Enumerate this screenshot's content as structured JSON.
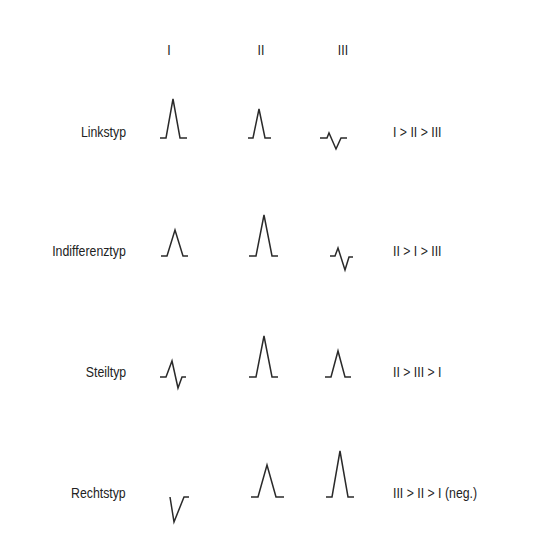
{
  "diagram": {
    "title": "",
    "column_headers": [
      "I",
      "II",
      "III"
    ],
    "rows": [
      {
        "label": "Linkstyp",
        "ranking": "I > II > III",
        "waves": {
          "I": "160,138 166,138 173,99 180,138 187,138",
          "II": "248,138 253,138 259,109 265,138 271,138",
          "III": "320,138 327,138 329,133 336,149 341,138 347,138"
        }
      },
      {
        "label": "Indifferenztyp",
        "ranking": "II > I > III",
        "waves": {
          "I": "161,256 167,256 175,230 183,256 188,256",
          "II": "249,256 256,256 264,215 272,256 278,256",
          "III": "330,256 335,256 338,248 345,270 349,257 353,257"
        }
      },
      {
        "label": "Steiltyp",
        "ranking": "II > III > I",
        "waves": {
          "I": "160,377 166,377 172,361 178,388 182,377 186,377",
          "II": "249,377 256,377 264,336 272,377 278,377",
          "III": "325,377 331,377 338,351 345,377 351,377"
        }
      },
      {
        "label": "Rechtstyp",
        "ranking": "III > II > I  (neg.)",
        "waves": {
          "I": "170,497 174,522 184,497 189,497",
          "II": "251,497 258,497 267,465 276,497 284,497",
          "III": "326,497 332,497 340,451 348,497 354,497"
        }
      }
    ]
  },
  "layout": {
    "column_x": [
      169,
      261,
      343
    ],
    "header_y": 42,
    "label_right_x": 126,
    "ranking_x": 393,
    "row_text_top": [
      124,
      243,
      364,
      485
    ]
  }
}
